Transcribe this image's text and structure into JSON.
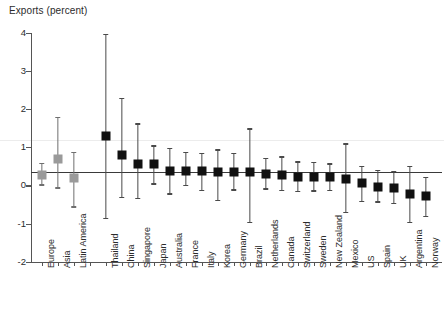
{
  "chart_data": {
    "type": "scatter",
    "title": "",
    "ylabel": "Exports (percent)",
    "xlabel": "",
    "ylim": [
      -2,
      4
    ],
    "yticks": [
      4,
      3,
      2,
      1,
      0,
      -1,
      -2
    ],
    "ytick_labels": [
      "4",
      "3",
      "2",
      "1",
      "0",
      "-1",
      "-2"
    ],
    "grid": false,
    "reference_line_y": 2.2,
    "zero_line": true,
    "legend": [],
    "series": [
      {
        "name": "Regions",
        "color": "#9a9a9a",
        "marker": "square",
        "points": [
          {
            "category": "Europe",
            "value": 0.28,
            "low": 0.03,
            "high": 0.6
          },
          {
            "category": "Asia",
            "value": 0.7,
            "low": -0.05,
            "high": 1.8
          },
          {
            "category": "Latin America",
            "value": 0.19,
            "low": -0.55,
            "high": 0.88
          }
        ]
      },
      {
        "name": "Countries",
        "color": "#111111",
        "marker": "square",
        "points": [
          {
            "category": "Thailand",
            "value": 1.3,
            "low": -0.85,
            "high": 3.97
          },
          {
            "category": "China",
            "value": 0.79,
            "low": -0.3,
            "high": 2.3
          },
          {
            "category": "Singapore",
            "value": 0.57,
            "low": -0.32,
            "high": 1.63
          },
          {
            "category": "Japan",
            "value": 0.56,
            "low": 0.05,
            "high": 1.05
          },
          {
            "category": "Australia",
            "value": 0.39,
            "low": -0.21,
            "high": 0.98
          },
          {
            "category": "France",
            "value": 0.37,
            "low": 0.02,
            "high": 0.88
          },
          {
            "category": "Italy",
            "value": 0.37,
            "low": -0.12,
            "high": 0.85
          },
          {
            "category": "Korea",
            "value": 0.36,
            "low": -0.38,
            "high": 0.95
          },
          {
            "category": "Germany",
            "value": 0.36,
            "low": -0.1,
            "high": 0.85
          },
          {
            "category": "Brazil",
            "value": 0.35,
            "low": -0.95,
            "high": 1.5
          },
          {
            "category": "Netherlands",
            "value": 0.3,
            "low": -0.08,
            "high": 0.72
          },
          {
            "category": "Canada",
            "value": 0.26,
            "low": -0.12,
            "high": 0.76
          },
          {
            "category": "Switzerland",
            "value": 0.23,
            "low": -0.15,
            "high": 0.63
          },
          {
            "category": "Sweden",
            "value": 0.22,
            "low": -0.13,
            "high": 0.62
          },
          {
            "category": "New Zealand",
            "value": 0.21,
            "low": -0.12,
            "high": 0.58
          },
          {
            "category": "Mexico",
            "value": 0.18,
            "low": -0.7,
            "high": 1.1
          },
          {
            "category": "US",
            "value": 0.05,
            "low": -0.4,
            "high": 0.52
          },
          {
            "category": "Spain",
            "value": -0.03,
            "low": -0.42,
            "high": 0.4
          },
          {
            "category": "UK",
            "value": -0.06,
            "low": -0.45,
            "high": 0.38
          },
          {
            "category": "Argentina",
            "value": -0.22,
            "low": -0.95,
            "high": 0.52
          },
          {
            "category": "Norway",
            "value": -0.28,
            "low": -0.8,
            "high": 0.22
          }
        ]
      }
    ],
    "categories": [
      "Europe",
      "Asia",
      "Latin America",
      "",
      "Thailand",
      "China",
      "Singapore",
      "Japan",
      "Australia",
      "France",
      "Italy",
      "Korea",
      "Germany",
      "Brazil",
      "Netherlands",
      "Canada",
      "Switzerland",
      "Sweden",
      "New Zealand",
      "Mexico",
      "US",
      "Spain",
      "UK",
      "Argentina",
      "Norway"
    ]
  }
}
